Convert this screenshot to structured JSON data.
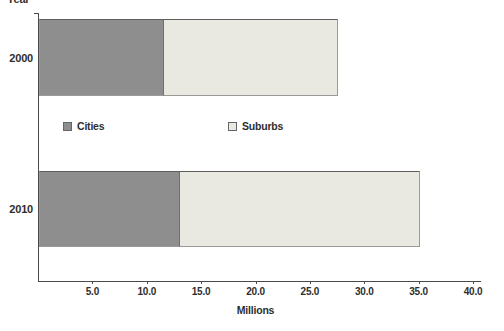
{
  "figure": {
    "background": "#ffffff",
    "text_color": "#2e2e2e",
    "axis_color": "#4a4a4a"
  },
  "chart_data": {
    "type": "bar",
    "orientation": "horizontal",
    "stacked": true,
    "title": "",
    "xlabel": "Millions",
    "ylabel": "Year",
    "categories": [
      "2000",
      "2010"
    ],
    "series": [
      {
        "name": "Cities",
        "values": [
          11.5,
          13.0
        ],
        "color": "#8e8e8e"
      },
      {
        "name": "Suburbs",
        "values": [
          16.0,
          22.0
        ],
        "color": "#eae9e1"
      }
    ],
    "totals": [
      27.5,
      35.0
    ],
    "xlim": [
      0,
      40
    ],
    "xtick_labels": [
      "5.0",
      "10.0",
      "15.0",
      "20.0",
      "25.0",
      "30.0",
      "35.0",
      "40.0"
    ],
    "legend": [
      "Cities",
      "Suburbs"
    ],
    "legend_position": "inside, between bars",
    "grid": false
  }
}
